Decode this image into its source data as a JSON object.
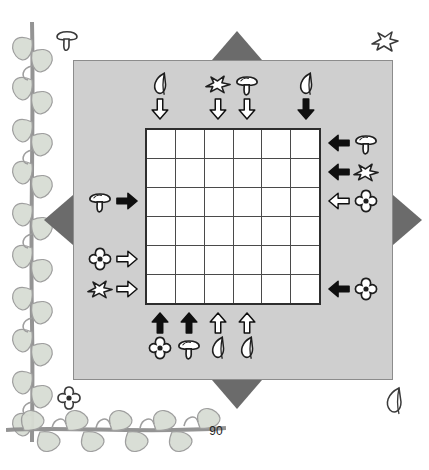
{
  "page": {
    "number": "90",
    "background_color": "#ffffff",
    "panel_color": "#cfcfcf",
    "marker_color": "#6b6b6b",
    "grid_line_color": "#4a4a4a",
    "cell_color": "#ffffff"
  },
  "puzzle": {
    "grid_rows": 6,
    "grid_cols": 6,
    "cells": [
      [
        "",
        "",
        "",
        "",
        "",
        ""
      ],
      [
        "",
        "",
        "",
        "",
        "",
        ""
      ],
      [
        "",
        "",
        "",
        "",
        "",
        ""
      ],
      [
        "",
        "",
        "",
        "",
        "",
        ""
      ],
      [
        "",
        "",
        "",
        "",
        "",
        ""
      ],
      [
        "",
        "",
        "",
        "",
        "",
        ""
      ]
    ]
  },
  "edge_markers": [
    {
      "name": "marker-top",
      "direction": "up"
    },
    {
      "name": "marker-bottom",
      "direction": "down"
    },
    {
      "name": "marker-left",
      "direction": "left"
    },
    {
      "name": "marker-right",
      "direction": "right"
    }
  ],
  "clues": {
    "top": [
      {
        "col": 1,
        "icon": "leaf-icon",
        "arrow": "arrow-down-outline",
        "filled": false
      },
      {
        "col": 3,
        "icon": "bird-icon",
        "arrow": "arrow-down-outline",
        "filled": false
      },
      {
        "col": 4,
        "icon": "mushroom-icon",
        "arrow": "arrow-down-outline",
        "filled": false
      },
      {
        "col": 6,
        "icon": "leaf-icon",
        "arrow": "arrow-down-filled",
        "filled": true
      }
    ],
    "bottom": [
      {
        "col": 1,
        "icon": "flower-icon",
        "arrow": "arrow-up-filled",
        "filled": true
      },
      {
        "col": 2,
        "icon": "mushroom-icon",
        "arrow": "arrow-up-filled",
        "filled": true
      },
      {
        "col": 3,
        "icon": "leaf-icon",
        "arrow": "arrow-up-outline",
        "filled": false
      },
      {
        "col": 4,
        "icon": "leaf-icon",
        "arrow": "arrow-up-outline",
        "filled": false
      }
    ],
    "left": [
      {
        "row": 3,
        "icon": "mushroom-icon",
        "arrow": "arrow-right-filled",
        "filled": true
      },
      {
        "row": 5,
        "icon": "flower-icon",
        "arrow": "arrow-right-outline",
        "filled": false
      },
      {
        "row": 6,
        "icon": "bird-icon",
        "arrow": "arrow-right-outline",
        "filled": false
      }
    ],
    "right": [
      {
        "row": 1,
        "icon": "mushroom-icon",
        "arrow": "arrow-left-filled",
        "filled": true
      },
      {
        "row": 2,
        "icon": "bird-icon",
        "arrow": "arrow-left-filled",
        "filled": true
      },
      {
        "row": 3,
        "icon": "flower-icon",
        "arrow": "arrow-left-outline",
        "filled": false
      },
      {
        "row": 6,
        "icon": "flower-icon",
        "arrow": "arrow-left-filled",
        "filled": true
      }
    ]
  },
  "decorations": [
    {
      "name": "corner-mushroom-top-left",
      "icon": "mushroom-icon"
    },
    {
      "name": "corner-bird-top-right",
      "icon": "bird-icon"
    },
    {
      "name": "corner-flower-bottom-left",
      "icon": "flower-icon"
    },
    {
      "name": "corner-leaf-bottom-right",
      "icon": "leaf-icon"
    },
    {
      "name": "vine-border-left",
      "icon": "vine-icon"
    },
    {
      "name": "vine-border-bottom",
      "icon": "vine-icon"
    }
  ]
}
